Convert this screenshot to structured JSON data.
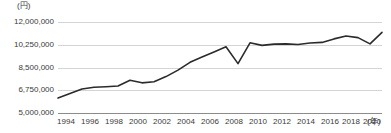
{
  "chart_data": {
    "type": "line",
    "title": "",
    "subtitle": "",
    "xlabel": "(年)",
    "ylabel": "(円)",
    "unit_label": "(円)",
    "x_unit_label": "(年)",
    "grid": true,
    "legend": "none",
    "ylim": [
      5000000,
      12000000
    ],
    "ytick_labels": [
      "12,000,000",
      "10,250,000",
      "8,500,000",
      "6,750,000",
      "5,000,000"
    ],
    "ytick_values": [
      12000000,
      10250000,
      8500000,
      6750000,
      5000000
    ],
    "xtick_labels": [
      "1994",
      "1996",
      "1998",
      "2000",
      "2002",
      "2004",
      "2006",
      "2008",
      "2010",
      "2012",
      "2014",
      "2016",
      "2018",
      "2020"
    ],
    "xtick_values": [
      1994,
      1996,
      1998,
      2000,
      2002,
      2004,
      2006,
      2008,
      2010,
      2012,
      2014,
      2016,
      2018,
      2020
    ],
    "xlim": [
      1994,
      2021
    ],
    "x": [
      1994,
      1995,
      1996,
      1997,
      1998,
      1999,
      2000,
      2001,
      2002,
      2003,
      2004,
      2005,
      2006,
      2007,
      2008,
      2009,
      2010,
      2011,
      2012,
      2013,
      2014,
      2015,
      2016,
      2017,
      2018,
      2019,
      2020,
      2021
    ],
    "series": [
      {
        "name": "",
        "color": "#2b2b2b",
        "values": [
          6150000,
          6500000,
          6850000,
          6980000,
          7020000,
          7080000,
          7520000,
          7320000,
          7400000,
          7800000,
          8300000,
          8900000,
          9300000,
          9700000,
          10100000,
          8800000,
          10400000,
          10200000,
          10300000,
          10320000,
          10270000,
          10380000,
          10430000,
          10700000,
          10920000,
          10800000,
          10320000,
          11200000
        ]
      }
    ]
  }
}
